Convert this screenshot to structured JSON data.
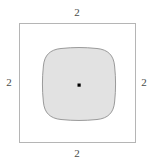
{
  "figure": {
    "type": "geometric-diagram",
    "background_color": "#ffffff",
    "outer_square": {
      "name": "outer-square",
      "stroke_color": "#b5b5b5",
      "fill_color": "none",
      "stroke_width": 1,
      "x": 19,
      "y": 23,
      "width": 117,
      "height": 120
    },
    "inner_shape": {
      "name": "rounded-square",
      "stroke_color": "#9a9a9a",
      "fill_color": "#e2e2e2",
      "stroke_width": 1,
      "x": 43,
      "y": 48,
      "width": 72,
      "height": 72,
      "corner_radius": 18,
      "edge_bulge": 3
    },
    "center_point": {
      "name": "center-dot",
      "color": "#000000",
      "cx": 79,
      "cy": 85,
      "size": 3
    },
    "labels": {
      "top": "2",
      "right": "2",
      "bottom": "2",
      "left": "2",
      "text_color": "#4a4a4a"
    }
  }
}
